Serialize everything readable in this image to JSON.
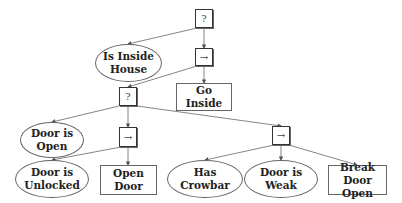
{
  "diagram": {
    "type": "behavior-tree",
    "colors": {
      "stroke": "#666666",
      "text": "#222222",
      "background": "#ffffff"
    },
    "nodes": {
      "root_fallback": {
        "kind": "fallback",
        "label": "?"
      },
      "is_inside_house": {
        "kind": "condition",
        "line1": "Is Inside",
        "line2": "House"
      },
      "seq_main": {
        "kind": "sequence",
        "label": "→"
      },
      "fallback_door": {
        "kind": "fallback",
        "label": "?"
      },
      "go_inside": {
        "kind": "action",
        "label": "Go Inside"
      },
      "door_is_open": {
        "kind": "condition",
        "line1": "Door is",
        "line2": "Open"
      },
      "seq_unlock": {
        "kind": "sequence",
        "label": "→"
      },
      "seq_break": {
        "kind": "sequence",
        "label": "→"
      },
      "door_is_unlocked": {
        "kind": "condition",
        "line1": "Door is",
        "line2": "Unlocked"
      },
      "open_door": {
        "kind": "action",
        "label": "Open Door"
      },
      "has_crowbar": {
        "kind": "condition",
        "line1": "Has",
        "line2": "Crowbar"
      },
      "door_is_weak": {
        "kind": "condition",
        "line1": "Door is",
        "line2": "Weak"
      },
      "break_door_open": {
        "kind": "action",
        "line1": "Break",
        "line2": "Door Open"
      }
    },
    "edges": [
      [
        "root_fallback",
        "is_inside_house"
      ],
      [
        "root_fallback",
        "seq_main"
      ],
      [
        "seq_main",
        "fallback_door"
      ],
      [
        "seq_main",
        "go_inside"
      ],
      [
        "fallback_door",
        "door_is_open"
      ],
      [
        "fallback_door",
        "seq_unlock"
      ],
      [
        "fallback_door",
        "seq_break"
      ],
      [
        "seq_unlock",
        "door_is_unlocked"
      ],
      [
        "seq_unlock",
        "open_door"
      ],
      [
        "seq_break",
        "has_crowbar"
      ],
      [
        "seq_break",
        "door_is_weak"
      ],
      [
        "seq_break",
        "break_door_open"
      ]
    ]
  }
}
